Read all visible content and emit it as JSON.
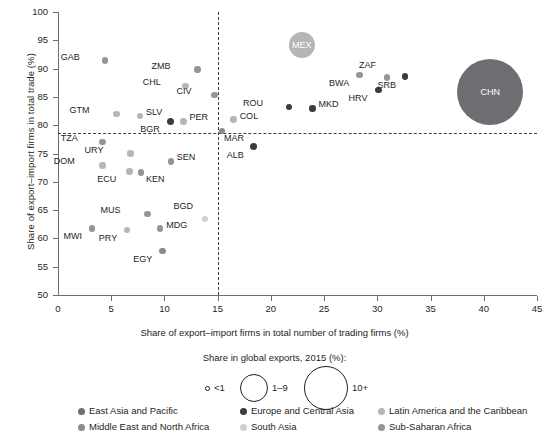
{
  "chart_data": {
    "type": "scatter",
    "title": "",
    "xlabel": "Share of export–import firms in total number of trading firms (%)",
    "ylabel": "Share of export–import firms in total trade (%)",
    "xlim": [
      0,
      45
    ],
    "ylim": [
      50,
      100
    ],
    "xticks": [
      0,
      5,
      10,
      15,
      20,
      25,
      30,
      35,
      40,
      45
    ],
    "yticks": [
      50,
      55,
      60,
      65,
      70,
      75,
      80,
      85,
      90,
      95,
      100
    ],
    "grid": false,
    "reference_lines": {
      "horizontal": 80,
      "vertical": 15,
      "style": "dashed"
    },
    "size_legend": {
      "title": "Share in global exports, 2015 (%):",
      "entries": [
        {
          "label": "<1",
          "radius_px": 2.5
        },
        {
          "label": "1–9",
          "radius_px": 14
        },
        {
          "label": "10+",
          "radius_px": 22
        }
      ]
    },
    "legend_position": "bottom",
    "legend": [
      {
        "name": "East Asia and Pacific",
        "color": "#6d6e71"
      },
      {
        "name": "Europe and Central Asia",
        "color": "#3c3c3b"
      },
      {
        "name": "Latin America and the Caribbean",
        "color": "#b5b6b8"
      },
      {
        "name": "Middle East and North Africa",
        "color": "#8a8b8e"
      },
      {
        "name": "South Asia",
        "color": "#cfd0d2"
      },
      {
        "name": "Sub-Saharan Africa",
        "color": "#939598"
      }
    ],
    "points": [
      {
        "code": "GAB",
        "x": 4.4,
        "y": 91.4,
        "r": 3.3,
        "color": "#939598",
        "group": "Sub-Saharan Africa",
        "lx": -25,
        "ly": -4
      },
      {
        "code": "ZMB",
        "x": 13.1,
        "y": 89.8,
        "r": 3.3,
        "color": "#939598",
        "group": "Sub-Saharan Africa",
        "lx": -27,
        "ly": -4
      },
      {
        "code": "CHL",
        "x": 12.0,
        "y": 86.9,
        "r": 3.3,
        "color": "#b5b6b8",
        "group": "Latin America and the Caribbean",
        "lx": -25,
        "ly": -4
      },
      {
        "code": "CIV",
        "x": 14.7,
        "y": 85.3,
        "r": 3.3,
        "color": "#939598",
        "group": "Sub-Saharan Africa",
        "lx": -23,
        "ly": -4
      },
      {
        "code": "MEX",
        "x": 22.9,
        "y": 94.1,
        "r": 13,
        "color": "#b5b6b8",
        "group": "Latin America and the Caribbean",
        "lx": 0,
        "ly": 0,
        "inside": true
      },
      {
        "code": "BWA",
        "x": 28.3,
        "y": 88.9,
        "r": 3.3,
        "color": "#939598",
        "group": "Sub-Saharan Africa",
        "lx": -10,
        "ly": 8
      },
      {
        "code": "ZAF",
        "x": 30.9,
        "y": 88.4,
        "r": 3.3,
        "color": "#939598",
        "group": "Sub-Saharan Africa",
        "lx": -11,
        "ly": -13
      },
      {
        "code": "SRB",
        "x": 32.6,
        "y": 88.6,
        "r": 3.3,
        "color": "#3c3c3b",
        "group": "Europe and Central Asia",
        "lx": -9,
        "ly": 8
      },
      {
        "code": "HRV",
        "x": 30.1,
        "y": 86.2,
        "r": 3.3,
        "color": "#3c3c3b",
        "group": "Europe and Central Asia",
        "lx": -11,
        "ly": 8
      },
      {
        "code": "CHN",
        "x": 40.6,
        "y": 85.8,
        "r": 33,
        "color": "#6d6e71",
        "group": "East Asia and Pacific",
        "lx": 0,
        "ly": 0,
        "inside": true
      },
      {
        "code": "ROU",
        "x": 21.7,
        "y": 83.2,
        "r": 3.3,
        "color": "#3c3c3b",
        "group": "Europe and Central Asia",
        "lx": -26,
        "ly": -4
      },
      {
        "code": "MKD",
        "x": 23.9,
        "y": 83.0,
        "r": 3.3,
        "color": "#3c3c3b",
        "group": "Europe and Central Asia",
        "lx": 6,
        "ly": -4
      },
      {
        "code": "GTM",
        "x": 5.5,
        "y": 82.0,
        "r": 3.3,
        "color": "#b5b6b8",
        "group": "Latin America and the Caribbean",
        "lx": -27,
        "ly": -4
      },
      {
        "code": "SLV",
        "x": 7.7,
        "y": 81.6,
        "r": 3.3,
        "color": "#b5b6b8",
        "group": "Latin America and the Caribbean",
        "lx": 6,
        "ly": -4
      },
      {
        "code": "PER",
        "x": 11.8,
        "y": 80.7,
        "r": 3.3,
        "color": "#b5b6b8",
        "group": "Latin America and the Caribbean",
        "lx": 6,
        "ly": -4
      },
      {
        "code": "BGR",
        "x": 10.6,
        "y": 80.6,
        "r": 3.6,
        "color": "#3c3c3b",
        "group": "Europe and Central Asia",
        "lx": -11,
        "ly": 7
      },
      {
        "code": "COL",
        "x": 16.5,
        "y": 81.0,
        "r": 3.3,
        "color": "#b5b6b8",
        "group": "Latin America and the Caribbean",
        "lx": 6,
        "ly": -4
      },
      {
        "code": "MAR",
        "x": 15.4,
        "y": 79.0,
        "r": 3.3,
        "color": "#8a8b8e",
        "group": "Middle East and North Africa",
        "lx": 2,
        "ly": 7
      },
      {
        "code": "TZA",
        "x": 4.2,
        "y": 77.0,
        "r": 3.3,
        "color": "#939598",
        "group": "Sub-Saharan Africa",
        "lx": -25,
        "ly": -4
      },
      {
        "code": "ALB",
        "x": 18.4,
        "y": 76.2,
        "r": 3.6,
        "color": "#3c3c3b",
        "group": "Europe and Central Asia",
        "lx": -10,
        "ly": 8
      },
      {
        "code": "URY",
        "x": 6.8,
        "y": 75.0,
        "r": 3.3,
        "color": "#b5b6b8",
        "group": "Latin America and the Caribbean",
        "lx": -27,
        "ly": -4
      },
      {
        "code": "SEN",
        "x": 10.6,
        "y": 73.6,
        "r": 3.3,
        "color": "#939598",
        "group": "Sub-Saharan Africa",
        "lx": 6,
        "ly": -4
      },
      {
        "code": "DOM",
        "x": 4.2,
        "y": 72.9,
        "r": 3.3,
        "color": "#b5b6b8",
        "group": "Latin America and the Caribbean",
        "lx": -28,
        "ly": -4
      },
      {
        "code": "ECU",
        "x": 6.7,
        "y": 71.8,
        "r": 3.3,
        "color": "#b5b6b8",
        "group": "Latin America and the Caribbean",
        "lx": -13,
        "ly": 7
      },
      {
        "code": "KEN",
        "x": 7.8,
        "y": 71.6,
        "r": 3.3,
        "color": "#939598",
        "group": "Sub-Saharan Africa",
        "lx": 5,
        "ly": 6
      },
      {
        "code": "MUS",
        "x": 8.4,
        "y": 64.3,
        "r": 3.3,
        "color": "#939598",
        "group": "Sub-Saharan Africa",
        "lx": -27,
        "ly": -4
      },
      {
        "code": "BGD",
        "x": 13.8,
        "y": 63.4,
        "r": 3.3,
        "color": "#cfd0d2",
        "group": "South Asia",
        "lx": -12,
        "ly": -13
      },
      {
        "code": "MWI",
        "x": 3.2,
        "y": 61.8,
        "r": 3.3,
        "color": "#939598",
        "group": "Sub-Saharan Africa",
        "lx": -10,
        "ly": 8
      },
      {
        "code": "PRY",
        "x": 6.5,
        "y": 61.5,
        "r": 3.3,
        "color": "#b5b6b8",
        "group": "Latin America and the Caribbean",
        "lx": -10,
        "ly": 8
      },
      {
        "code": "MDG",
        "x": 9.6,
        "y": 61.7,
        "r": 3.3,
        "color": "#939598",
        "group": "Sub-Saharan Africa",
        "lx": 6,
        "ly": -4
      },
      {
        "code": "EGY",
        "x": 9.8,
        "y": 57.8,
        "r": 3.3,
        "color": "#8a8b8e",
        "group": "Middle East and North Africa",
        "lx": -10,
        "ly": 8
      }
    ]
  }
}
